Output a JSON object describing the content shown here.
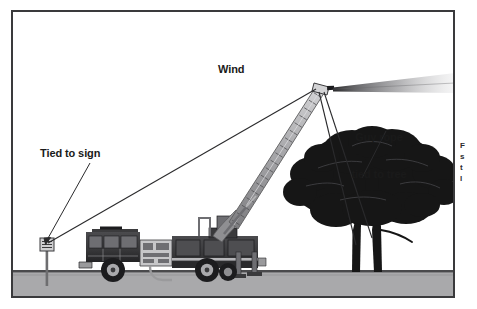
{
  "figure": {
    "kind": "technical-illustration",
    "frame": {
      "border_color": "#3a3a3c",
      "background_color": "#ffffff"
    }
  },
  "labels": {
    "wind": "Wind",
    "tied_to_sign": "Tied to sign",
    "guy_rope_line1": "Guy rope",
    "guy_rope_line2": "tied to tree"
  },
  "cut_off_text": {
    "line1": "F",
    "line2": "s",
    "line3": "t",
    "line4": "l"
  },
  "colors": {
    "ground": "#a9a9ab",
    "ground_line": "#4a4a4c",
    "tree": "#161616",
    "truck_body": "#3d3d3f",
    "truck_dark": "#1c1c1e",
    "truck_light": "#9a9a9c",
    "ladder": "#b4b4b6",
    "ladder_edge": "#5c5c5e",
    "rope": "#2a2a2c",
    "leader": "#2a2a2c",
    "spray": "#8d8d90",
    "sign": "#6e6e70",
    "label_text": "#1a1a1a"
  },
  "elements": {
    "ground_band": {
      "label": "ground",
      "top": 272,
      "height": 24
    },
    "sign_post": {
      "label": "roadside sign post",
      "x": 44,
      "base_y": 286,
      "top_y": 240
    },
    "fire_truck": {
      "label": "fire engine with aerial ladder",
      "x": 78,
      "y": 228,
      "width": 190,
      "height": 58
    },
    "aerial_ladder": {
      "label": "extended aerial ladder boom",
      "tip_x": 320,
      "tip_y": 88,
      "base_x": 232,
      "base_y": 232
    },
    "nozzle_spray": {
      "label": "water stream from nozzle",
      "from_x": 328,
      "from_y": 90,
      "to_x": 455,
      "to_y": 84
    },
    "tree": {
      "label": "deciduous tree silhouette",
      "center_x": 372,
      "canopy_top": 132,
      "base_y": 286
    },
    "guy_rope_to_sign": {
      "from_x": 318,
      "from_y": 89,
      "to_x": 47,
      "to_y": 245
    },
    "guy_rope_to_tree_a": {
      "from_x": 322,
      "from_y": 92,
      "to_x": 360,
      "to_y": 240
    },
    "guy_rope_to_tree_b": {
      "from_x": 325,
      "from_y": 92,
      "to_x": 378,
      "to_y": 235
    },
    "leader_tied_to_sign": {
      "from_x": 88,
      "from_y": 166,
      "to_x": 48,
      "to_y": 242
    },
    "leader_guy_rope": {
      "from_x": 386,
      "from_y": 134,
      "to_x": 364,
      "to_y": 177
    }
  }
}
